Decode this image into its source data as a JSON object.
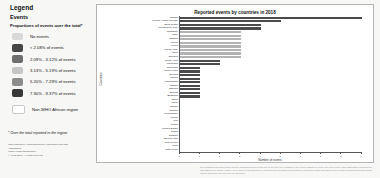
{
  "legend": {
    "title": "Legend",
    "subtitle": "Events",
    "caption": "Proportions of events over the total*",
    "items": [
      {
        "label": "No events",
        "color": "#d9d9d9"
      },
      {
        "label": "< 2.08% of events",
        "color": "#474747"
      },
      {
        "label": "2.09% - 3.12% of events",
        "color": "#6f6f6f"
      },
      {
        "label": "3.13% - 5.19% of events",
        "color": "#c6c6c6"
      },
      {
        "label": "5.20% - 7.29% of events",
        "color": "#8d8d8d"
      },
      {
        "label": "7.30% - 9.37% of events",
        "color": "#383838"
      }
    ],
    "non_who": {
      "label": "Non-WHO African region",
      "color": "#ffffff"
    },
    "footnote": "* Over the total reported in the region",
    "credits": [
      "Map production: Health Emergency Information and Risk",
      "Assessment",
      "World Health Organization",
      "© WHO 2018. All rights reserved."
    ]
  },
  "chart_data": {
    "type": "bar",
    "orientation": "horizontal",
    "title": "Reported events by countries in 2018",
    "xlabel": "Number of events",
    "ylabel": "Countries",
    "xlim": [
      0,
      9
    ],
    "xticks": [
      0,
      1,
      2,
      3,
      4,
      5,
      6,
      7,
      8,
      9
    ],
    "grid": false,
    "legend_position": "none",
    "categories": [
      "Uganda",
      "Central African Republic",
      "South Sudan",
      "Congo Dem. Rep.",
      "Zimbabwe",
      "Niger",
      "Namibia",
      "Liberia",
      "Kenya",
      "Congo, Rep.",
      "Angola",
      "Tanzania",
      "South Africa",
      "Mauritania",
      "Cameroon",
      "Sierra Leone",
      "Senegal",
      "Nigeria",
      "Madagascar",
      "Gambia",
      "Ethiopia",
      "Burundi",
      "Botswana",
      "Benin",
      "Algeria",
      "Zambia",
      "Rwanda",
      "Mozambique",
      "Malawi",
      "Mali",
      "Gabon",
      "Guinea-Bissau",
      "Ghana",
      "Eswatini",
      "Burkina Faso",
      "Côte d'Ivoire",
      "Chad",
      "Cabo Verde"
    ],
    "values": [
      9,
      5,
      4,
      4,
      3,
      3,
      3,
      3,
      3,
      3,
      3,
      3,
      2,
      2,
      1,
      1,
      1,
      1,
      1,
      1,
      1,
      1,
      1,
      0,
      0,
      0,
      0,
      0,
      0,
      0,
      0,
      0,
      0,
      0,
      0,
      0,
      0,
      0
    ],
    "bar_shades": [
      "dark",
      "dark",
      "dark",
      "dark",
      "light",
      "light",
      "light",
      "light",
      "light",
      "light",
      "light",
      "light",
      "dark",
      "dark",
      "dark",
      "dark",
      "dark",
      "dark",
      "dark",
      "dark",
      "dark",
      "dark",
      "dark",
      "dark",
      "dark",
      "dark",
      "dark",
      "dark",
      "dark",
      "dark",
      "dark",
      "dark",
      "dark",
      "dark",
      "dark",
      "dark",
      "dark",
      "dark"
    ],
    "colors": {
      "bar_dark": "#4a4a4a",
      "bar_light": "#b3b3b3",
      "axis": "#555555"
    }
  },
  "disclaimer": "The boundaries and names shown and the designations used on this map do not imply the expression of any opinion whatsoever on the part of the World Health Organization concerning the legal status of any country, territory, city or area or of its authorities, or concerning the delimitation of its frontiers or boundaries. Dotted and dashed lines on maps represent approximate border lines for which there may not yet be full agreement."
}
